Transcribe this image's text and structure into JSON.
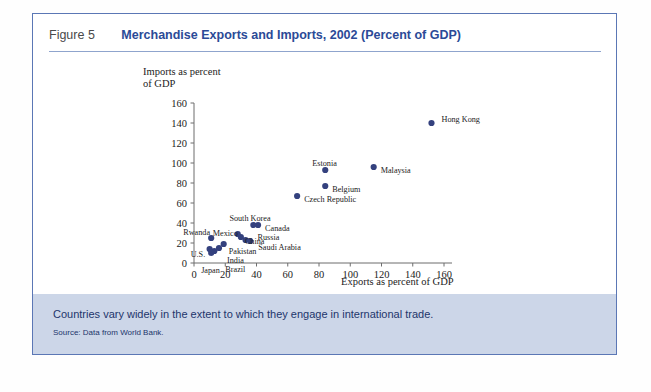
{
  "figure": {
    "number": "Figure 5",
    "title": "Merchandise Exports and Imports, 2002 (Percent of GDP)"
  },
  "footer": {
    "caption": "Countries vary widely in the extent to which they engage in international trade.",
    "source": "Source: Data from World Bank."
  },
  "colors": {
    "title_blue": "#2b4a97",
    "frame_blue": "#5b77b5",
    "marker": "#34417e",
    "footer_band": "#ccd6e8",
    "axis": "#6d6d6d"
  },
  "chart_data": {
    "type": "scatter",
    "title": "Merchandise Exports and Imports, 2002 (Percent of GDP)",
    "xlabel": "Exports as percent of GDP",
    "ylabel": "Imports as percent\nof GDP",
    "ylabel_line1": "Imports as percent",
    "ylabel_line2": "of GDP",
    "xlim": [
      0,
      160
    ],
    "ylim": [
      0,
      160
    ],
    "xticks": [
      0,
      20,
      40,
      60,
      80,
      100,
      120,
      140,
      160
    ],
    "yticks": [
      0,
      20,
      40,
      60,
      80,
      100,
      120,
      140,
      160
    ],
    "grid": false,
    "legend": "none",
    "marker_color": "#34417e",
    "points": [
      {
        "name": "Hong Kong",
        "x": 152,
        "y": 140,
        "lx": 10,
        "ly": -4
      },
      {
        "name": "Malaysia",
        "x": 115,
        "y": 96,
        "lx": 7,
        "ly": 3
      },
      {
        "name": "Estonia",
        "x": 84,
        "y": 93,
        "lx": -13,
        "ly": -7
      },
      {
        "name": "Belgium",
        "x": 84,
        "y": 77,
        "lx": 7,
        "ly": 3
      },
      {
        "name": "Czech Republic",
        "x": 66,
        "y": 67,
        "lx": 7,
        "ly": 3
      },
      {
        "name": "Canada",
        "x": 41,
        "y": 38,
        "lx": 7,
        "ly": 3
      },
      {
        "name": "South Korea",
        "x": 38,
        "y": 38,
        "lx": -24,
        "ly": -7
      },
      {
        "name": "Russia",
        "x": 33,
        "y": 23,
        "lx": 12,
        "ly": -3
      },
      {
        "name": "Saudi Arabia",
        "x": 36,
        "y": 22,
        "lx": 8,
        "ly": 6
      },
      {
        "name": "China",
        "x": 30,
        "y": 26,
        "lx": 4,
        "ly": 4
      },
      {
        "name": "Mexico",
        "x": 28,
        "y": 29,
        "lx": -25,
        "ly": -1
      },
      {
        "name": "Pakistan",
        "x": 19,
        "y": 19,
        "lx": 5,
        "ly": 7
      },
      {
        "name": "India",
        "x": 16,
        "y": 15,
        "lx": 8,
        "ly": 12
      },
      {
        "name": "Brazil",
        "x": 13,
        "y": 12,
        "lx": 11,
        "ly": 18
      },
      {
        "name": "Japan",
        "x": 11,
        "y": 10,
        "lx": -10,
        "ly": 17
      },
      {
        "name": "U.S.",
        "x": 10,
        "y": 14,
        "lx": -19,
        "ly": 5
      },
      {
        "name": "Rwanda",
        "x": 11,
        "y": 25,
        "lx": -28,
        "ly": -6
      }
    ]
  }
}
